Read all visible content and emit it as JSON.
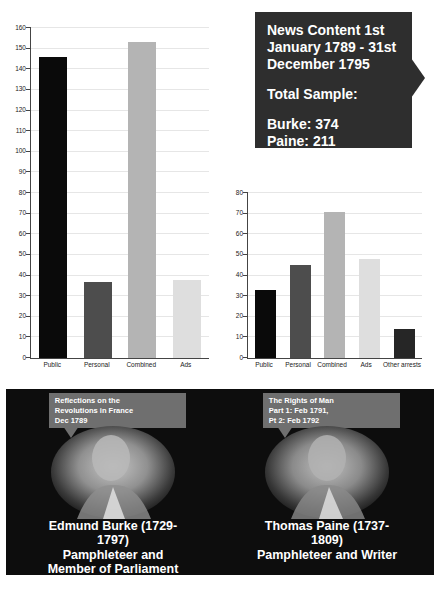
{
  "page": {
    "background": "#ffffff",
    "panel_background": "#0d0d0d"
  },
  "callout": {
    "title": "News Content 1st\nJanuary 1789 - 31st\nDecember 1795",
    "subtitle": "Total Sample:",
    "burke_total": "Burke: 374",
    "paine_total": "Paine: 211",
    "bg": "#2e2e2e",
    "text_color": "#ffffff"
  },
  "chart_data": [
    {
      "type": "bar",
      "title": "",
      "categories": [
        "Public",
        "Personal",
        "Combined",
        "Ads"
      ],
      "values": [
        146,
        37,
        153,
        38
      ],
      "bar_colors": [
        "#0a0a0a",
        "#4d4d4d",
        "#b4b4b4",
        "#dedede"
      ],
      "xlabel": "",
      "ylabel": "",
      "ylim": [
        0,
        160
      ],
      "ytick_step": 10,
      "grid": true,
      "legend": "none"
    },
    {
      "type": "bar",
      "title": "",
      "categories": [
        "Public",
        "Personal",
        "Combined",
        "Ads",
        "Other arrests"
      ],
      "values": [
        33,
        45,
        71,
        48,
        14
      ],
      "bar_colors": [
        "#0a0a0a",
        "#4d4d4d",
        "#b4b4b4",
        "#dedede",
        "#262626"
      ],
      "xlabel": "",
      "ylabel": "",
      "ylim": [
        0,
        80
      ],
      "ytick_step": 10,
      "grid": true,
      "legend": "none"
    }
  ],
  "figures": [
    {
      "bubble": "Reflections on the\nRevolutions in France\nDec 1789",
      "name": "Edmund Burke (1729-\n1797)",
      "role": "Pamphleteer and\nMember of Parliament"
    },
    {
      "bubble": "The Rights of Man\nPart 1: Feb 1791,\nPt 2: Feb 1792",
      "name": "Thomas Paine (1737-\n1809)",
      "role": "Pamphleteer and Writer"
    }
  ],
  "bubble_color": "#6f6f6f"
}
